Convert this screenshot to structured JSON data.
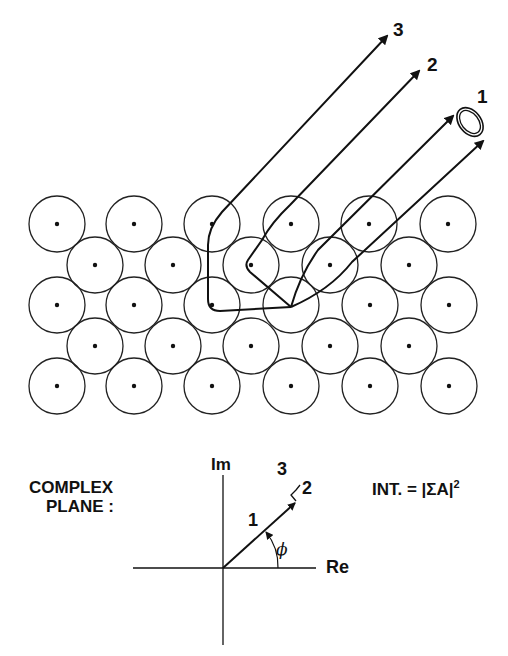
{
  "diagram": {
    "lattice": {
      "rows": [
        {
          "y": 224,
          "xs": [
            57,
            134,
            212,
            291,
            369,
            448
          ]
        },
        {
          "y": 265,
          "xs": [
            95,
            173,
            251,
            330,
            409
          ]
        },
        {
          "y": 305,
          "xs": [
            57,
            134,
            212,
            291,
            370,
            449
          ]
        },
        {
          "y": 346,
          "xs": [
            95,
            173,
            251,
            330,
            409
          ]
        },
        {
          "y": 386,
          "xs": [
            57,
            134,
            212,
            291,
            370,
            449
          ]
        }
      ],
      "radius": 28,
      "origin_atom": {
        "x": 291,
        "y": 307
      }
    },
    "paths": [
      {
        "label": "1",
        "note": "direct emission (two edge rays with detector ring)"
      },
      {
        "label": "2",
        "note": "single scattering"
      },
      {
        "label": "3",
        "note": "double scattering"
      }
    ],
    "path_labels": {
      "p1": "1",
      "p2": "2",
      "p3": "3"
    },
    "complex_plane": {
      "title_line1": "COMPLEX",
      "title_line2": "PLANE :",
      "axis_im": "Im",
      "axis_re": "Re",
      "vector_label_1": "1",
      "vector_label_2": "2",
      "vector_label_3": "3",
      "angle_label": "ϕ",
      "intensity_formula": "INT. = |ΣA|",
      "intensity_exponent": "2"
    }
  }
}
